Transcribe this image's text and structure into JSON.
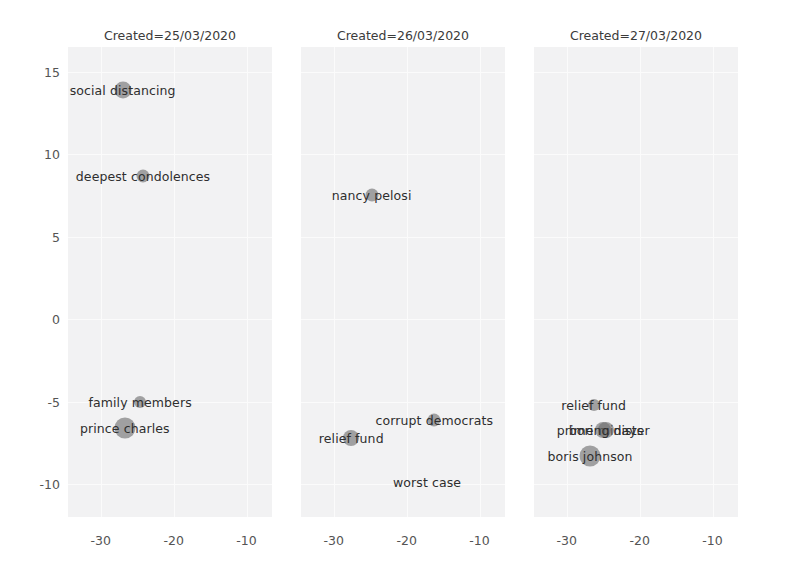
{
  "chart_data": {
    "type": "scatter",
    "title": "",
    "xlabel": "",
    "ylabel": "",
    "xlim": [
      -34.5,
      -6.5
    ],
    "ylim": [
      -12.0,
      16.5
    ],
    "grid": true,
    "legend": "none",
    "facet_variable": "Created",
    "facets": [
      {
        "title": "Created=25/03/2020",
        "xticks": [
          "-30",
          "-20",
          "-10"
        ],
        "xtickvalues": [
          -30,
          -20,
          -10
        ],
        "points": [
          {
            "label": "social distancing",
            "x": -27.0,
            "y": 13.9,
            "size": 17
          },
          {
            "label": "deepest condolences",
            "x": -24.2,
            "y": 8.7,
            "size": 13
          },
          {
            "label": "family members",
            "x": -24.6,
            "y": -5.0,
            "size": 12
          },
          {
            "label": "prince charles",
            "x": -26.7,
            "y": -6.6,
            "size": 21
          }
        ]
      },
      {
        "title": "Created=26/03/2020",
        "xticks": [
          "-30",
          "-20",
          "-10"
        ],
        "xtickvalues": [
          -30,
          -20,
          -10
        ],
        "points": [
          {
            "label": "nancy pelosi",
            "x": -24.8,
            "y": 7.5,
            "size": 13
          },
          {
            "label": "relief fund",
            "x": -27.6,
            "y": -7.2,
            "size": 16
          },
          {
            "label": "corrupt democrats",
            "x": -16.2,
            "y": -6.1,
            "size": 13
          },
          {
            "label": "worst case",
            "x": -17.2,
            "y": -9.9,
            "size": 0
          }
        ]
      },
      {
        "title": "Created=27/03/2020",
        "xticks": [
          "-30",
          "-20",
          "-10"
        ],
        "xtickvalues": [
          -30,
          -20,
          -10
        ],
        "points": [
          {
            "label": "relief fund",
            "x": -26.3,
            "y": -5.2,
            "size": 12
          },
          {
            "label": "prime minister",
            "x": -25.0,
            "y": -6.7,
            "size": 16
          },
          {
            "label": "boring days",
            "x": -24.6,
            "y": -6.7,
            "size": 16
          },
          {
            "label": "boris johnson",
            "x": -26.8,
            "y": -8.3,
            "size": 21
          }
        ]
      }
    ],
    "yticks": [
      "15",
      "10",
      "5",
      "0",
      "-5",
      "-10"
    ],
    "ytickvalues": [
      15,
      10,
      5,
      0,
      -5,
      -10
    ],
    "marker_color": "#6e6e6e",
    "marker_opacity": 0.62,
    "panel_background": "#f2f2f3",
    "grid_color": "#fbfbfb",
    "figure_background": "#ffffff",
    "tick_label_color": "#545454",
    "title_color": "#3b3b3b"
  }
}
